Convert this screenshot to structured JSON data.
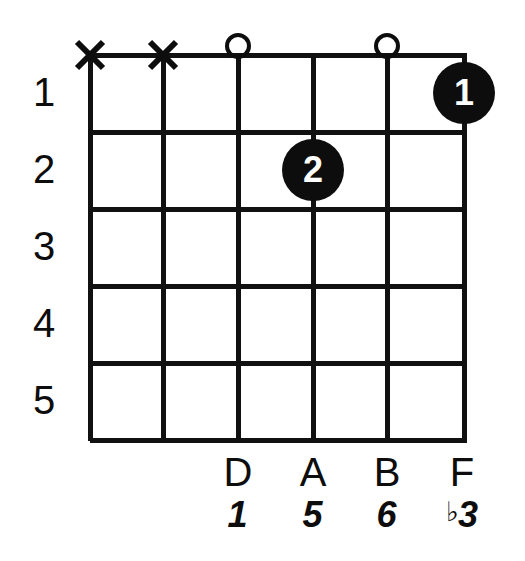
{
  "diagram": {
    "type": "guitar-chord-diagram",
    "string_count": 6,
    "fret_count": 5,
    "ink_color": "#0d0d0d",
    "background_color": "#ffffff",
    "dot_text_color": "#ffffff"
  },
  "fret_numbers": [
    {
      "label": "1"
    },
    {
      "label": "2"
    },
    {
      "label": "3"
    },
    {
      "label": "4"
    },
    {
      "label": "5"
    }
  ],
  "top_markers": [
    {
      "string": 1,
      "symbol": "X",
      "meaning": "muted"
    },
    {
      "string": 2,
      "symbol": "X",
      "meaning": "muted"
    },
    {
      "string": 3,
      "symbol": "O",
      "meaning": "open"
    },
    {
      "string": 5,
      "symbol": "O",
      "meaning": "open"
    }
  ],
  "finger_dots": [
    {
      "label": "1",
      "string": 6,
      "fret": 1
    },
    {
      "label": "2",
      "string": 4,
      "fret": 2
    }
  ],
  "note_names": [
    {
      "string": 3,
      "label": "D"
    },
    {
      "string": 4,
      "label": "A"
    },
    {
      "string": 5,
      "label": "B"
    },
    {
      "string": 6,
      "label": "F"
    }
  ],
  "scale_degrees": [
    {
      "string": 3,
      "accidental": "",
      "label": "1"
    },
    {
      "string": 4,
      "accidental": "",
      "label": "5"
    },
    {
      "string": 5,
      "accidental": "",
      "label": "6"
    },
    {
      "string": 6,
      "accidental": "♭",
      "label": "3"
    }
  ]
}
